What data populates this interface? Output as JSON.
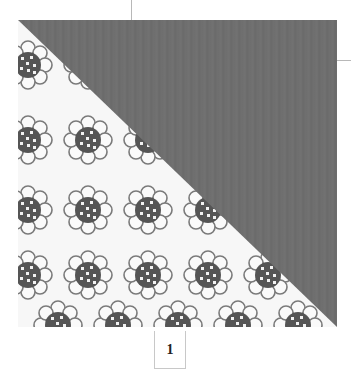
{
  "figure": {
    "solid_color": "#6e6e6e",
    "print_background": "#f7f7f7",
    "print_motif": "flower"
  },
  "page": {
    "number": "1"
  }
}
